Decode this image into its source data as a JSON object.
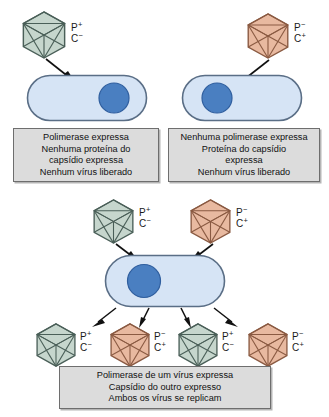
{
  "diagram": {
    "colors": {
      "virus_green_fill": "#c6d6cd",
      "virus_green_stroke": "#4a5f58",
      "virus_orange_fill": "#e8b9a0",
      "virus_orange_stroke": "#8a5a42",
      "cell_fill": "#d6e4f5",
      "cell_stroke": "#5a6e86",
      "nucleus_fill": "#4a7fc1",
      "nucleus_stroke": "#2f5e9e",
      "caption_fill": "#dcdcdc",
      "caption_stroke": "#6e6e6e",
      "arrow": "#111111"
    },
    "labels": {
      "p_plus": "P",
      "p_minus": "P",
      "c_plus": "C",
      "c_minus": "C",
      "sup_plus": "+",
      "sup_minus": "−"
    }
  },
  "panels": {
    "left": {
      "name": "infeccao-virus-verde",
      "virus": {
        "type": "green",
        "p": "P",
        "p_sign": "+",
        "c": "C",
        "c_sign": "−"
      },
      "cell": {
        "nucleus_side": "right"
      },
      "caption": {
        "lines": [
          "Polimerase expressa",
          "Nenhuma proteína do",
          "capsídio expressa",
          "Nenhum vírus liberado"
        ]
      }
    },
    "right": {
      "name": "infeccao-virus-laranja",
      "virus": {
        "type": "orange",
        "p": "P",
        "p_sign": "−",
        "c": "C",
        "c_sign": "+"
      },
      "cell": {
        "nucleus_side": "left"
      },
      "caption": {
        "lines": [
          "Nenhuma polimerase expressa",
          "Proteína do capsídio",
          "expressa",
          "Nenhum vírus liberado"
        ]
      }
    },
    "bottom": {
      "name": "coinfeccao-complementacao",
      "input_viruses": [
        {
          "type": "green",
          "p": "P",
          "p_sign": "+",
          "c": "C",
          "c_sign": "−"
        },
        {
          "type": "orange",
          "p": "P",
          "p_sign": "−",
          "c": "C",
          "c_sign": "+"
        }
      ],
      "cell": {
        "nucleus_side": "left"
      },
      "progeny_viruses": [
        {
          "type": "green",
          "p": "P",
          "p_sign": "+",
          "c": "C",
          "c_sign": "−"
        },
        {
          "type": "orange",
          "p": "P",
          "p_sign": "−",
          "c": "C",
          "c_sign": "+"
        },
        {
          "type": "green",
          "p": "P",
          "p_sign": "+",
          "c": "C",
          "c_sign": "−"
        },
        {
          "type": "orange",
          "p": "P",
          "p_sign": "−",
          "c": "C",
          "c_sign": "+"
        }
      ],
      "caption": {
        "lines": [
          "Polimerase de um vírus expressa",
          "Capsídio do outro expresso",
          "Ambos os vírus se replicam"
        ]
      }
    }
  }
}
